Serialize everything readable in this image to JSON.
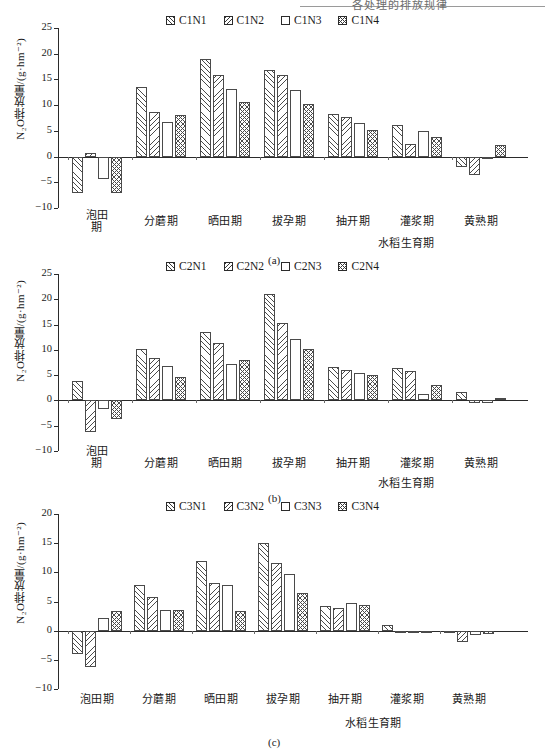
{
  "page": {
    "top_fragment": "各处理的排放规律"
  },
  "panels": [
    {
      "id": "a",
      "caption": "(a)",
      "legend": [
        {
          "label": "C1N1",
          "pattern": "diagonal-hatch"
        },
        {
          "label": "C1N2",
          "pattern": "reverse-diagonal-hatch"
        },
        {
          "label": "C1N3",
          "pattern": "empty"
        },
        {
          "label": "C1N4",
          "pattern": "checker-hatch"
        }
      ],
      "ylabel": "N₂O排放量/(g·hm⁻²)",
      "xlabel": "水稻生育期"
    },
    {
      "id": "b",
      "caption": "(b)",
      "legend": [
        {
          "label": "C2N1",
          "pattern": "diagonal-hatch"
        },
        {
          "label": "C2N2",
          "pattern": "reverse-diagonal-hatch"
        },
        {
          "label": "C2N3",
          "pattern": "empty"
        },
        {
          "label": "C2N4",
          "pattern": "checker-hatch"
        }
      ],
      "ylabel": "N₂O排放量/(g·hm⁻²)",
      "xlabel": "水稻生育期"
    },
    {
      "id": "c",
      "caption": "(c)",
      "legend": [
        {
          "label": "C3N1",
          "pattern": "diagonal-hatch"
        },
        {
          "label": "C3N2",
          "pattern": "reverse-diagonal-hatch"
        },
        {
          "label": "C3N3",
          "pattern": "empty"
        },
        {
          "label": "C3N4",
          "pattern": "checker-hatch"
        }
      ],
      "ylabel": "N₂O排放量/(g·hm⁻²)",
      "xlabel": "水稻生育期"
    }
  ],
  "chart_data": [
    {
      "type": "bar",
      "title": "(a)",
      "xlabel": "水稻生育期",
      "ylabel": "N₂O排放量/(g·hm⁻²)",
      "ylim": [
        -10,
        25
      ],
      "yticks": [
        -10,
        -5,
        0,
        5,
        10,
        15,
        20,
        25
      ],
      "grid": false,
      "legend_position": "top-center",
      "categories": [
        "泡田期",
        "分蘑期",
        "晒田期",
        "拔孕期",
        "抽开期",
        "灌浆期",
        "黄熟期"
      ],
      "series": [
        {
          "name": "C1N1",
          "values": [
            -7.0,
            13.6,
            18.9,
            16.8,
            8.3,
            6.2,
            -2.0
          ]
        },
        {
          "name": "C1N2",
          "values": [
            0.7,
            8.6,
            15.9,
            15.8,
            7.6,
            2.5,
            -3.6
          ]
        },
        {
          "name": "C1N3",
          "values": [
            -4.3,
            6.8,
            13.1,
            13.0,
            6.5,
            5.0,
            0.0
          ]
        },
        {
          "name": "C1N4",
          "values": [
            -7.0,
            8.1,
            10.6,
            10.3,
            5.1,
            3.8,
            2.2
          ]
        }
      ]
    },
    {
      "type": "bar",
      "title": "(b)",
      "xlabel": "水稻生育期",
      "ylabel": "N₂O排放量/(g·hm⁻²)",
      "ylim": [
        -10,
        25
      ],
      "yticks": [
        -10,
        -5,
        0,
        5,
        10,
        15,
        20,
        25
      ],
      "grid": false,
      "legend_position": "top-center",
      "categories": [
        "泡田期",
        "分蘑期",
        "晒田期",
        "拔孕期",
        "抽开期",
        "灌浆期",
        "黄熟期"
      ],
      "series": [
        {
          "name": "C2N1",
          "values": [
            3.9,
            10.2,
            13.5,
            21.0,
            6.7,
            6.5,
            1.6
          ]
        },
        {
          "name": "C2N2",
          "values": [
            -6.3,
            8.3,
            11.4,
            15.3,
            6.0,
            5.8,
            -0.6
          ]
        },
        {
          "name": "C2N3",
          "values": [
            -1.7,
            6.8,
            7.3,
            12.2,
            5.5,
            1.3,
            -0.6
          ]
        },
        {
          "name": "C2N4",
          "values": [
            -3.6,
            4.7,
            8.0,
            10.1,
            5.0,
            3.0,
            0.4
          ]
        }
      ]
    },
    {
      "type": "bar",
      "title": "(c)",
      "xlabel": "水稻生育期",
      "ylabel": "N₂O排放量/(g·hm⁻²)",
      "ylim": [
        -10,
        20
      ],
      "yticks": [
        -10,
        -5,
        0,
        5,
        10,
        15,
        20
      ],
      "grid": false,
      "legend_position": "top-center",
      "categories": [
        "泡田期",
        "分蘑期",
        "晒田期",
        "拔孕期",
        "抽开期",
        "灌浆期",
        "黄熟期"
      ],
      "series": [
        {
          "name": "C3N1",
          "values": [
            -4.0,
            7.8,
            11.9,
            15.1,
            4.2,
            1.0,
            -0.4
          ]
        },
        {
          "name": "C3N2",
          "values": [
            -6.3,
            5.8,
            8.1,
            11.6,
            3.9,
            -0.3,
            -2.0
          ]
        },
        {
          "name": "C3N3",
          "values": [
            2.2,
            3.6,
            7.8,
            9.8,
            4.8,
            0.0,
            -0.8
          ]
        },
        {
          "name": "C3N4",
          "values": [
            3.3,
            3.6,
            3.4,
            6.4,
            4.4,
            0.0,
            -0.5
          ]
        }
      ]
    }
  ]
}
